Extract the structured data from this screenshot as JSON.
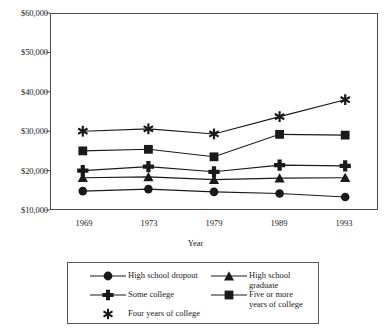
{
  "chart_data": {
    "type": "line",
    "title": "",
    "xlabel": "Year",
    "ylabel": "",
    "categories": [
      "1969",
      "1973",
      "1979",
      "1989",
      "1993"
    ],
    "x": [
      1969,
      1973,
      1979,
      1989,
      1993
    ],
    "ylim": [
      10000,
      60000
    ],
    "ytick_values": [
      10000,
      20000,
      30000,
      40000,
      50000,
      60000
    ],
    "ytick_labels": [
      "$10,000",
      "$20,000",
      "$30,000",
      "$40,000",
      "$50,000",
      "$60,000"
    ],
    "grid": false,
    "legend_position": "below-plot",
    "series": [
      {
        "name": "High school dropout",
        "marker": "circle",
        "color": "#1a1a1a",
        "values": [
          14800,
          15300,
          14600,
          14200,
          13300
        ]
      },
      {
        "name": "High school graduate",
        "marker": "triangle",
        "color": "#1a1a1a",
        "values": [
          18200,
          18400,
          17700,
          18100,
          18200
        ]
      },
      {
        "name": "Some college",
        "marker": "plus",
        "color": "#1a1a1a",
        "values": [
          20000,
          21000,
          19700,
          21400,
          21200
        ]
      },
      {
        "name": "Five or more years of college",
        "marker": "square",
        "color": "#1a1a1a",
        "values": [
          25000,
          25400,
          23500,
          29200,
          29000
        ]
      },
      {
        "name": "Four years of college",
        "marker": "asterisk",
        "color": "#1a1a1a",
        "values": [
          30000,
          30600,
          29300,
          33700,
          38000
        ]
      }
    ]
  },
  "legend": {
    "entries": [
      {
        "label": "High school dropout",
        "marker": "circle"
      },
      {
        "label": "High school graduate",
        "marker": "triangle"
      },
      {
        "label": "Some college",
        "marker": "plus"
      },
      {
        "label": "Five or more\nyears of college",
        "marker": "square"
      },
      {
        "label": "Four years of college",
        "marker": "asterisk"
      }
    ]
  },
  "axes": {
    "x_title": "Year"
  }
}
